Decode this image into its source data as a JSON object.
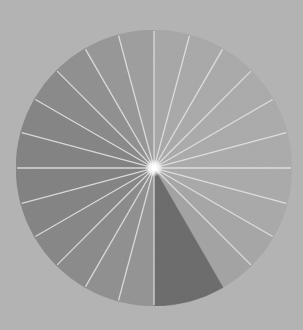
{
  "stimulus": {
    "canvas": {
      "width": 303,
      "height": 330,
      "background": "#b3b3b3"
    },
    "disc": {
      "cx": 154,
      "cy": 168,
      "r": 138
    },
    "sector_angle_deg": 15,
    "sectors": [
      {
        "start": 0,
        "end": 15,
        "color": "#a9a9a9"
      },
      {
        "start": 15,
        "end": 30,
        "color": "#ababab"
      },
      {
        "start": 30,
        "end": 45,
        "color": "#acacac"
      },
      {
        "start": 45,
        "end": 60,
        "color": "#adadad"
      },
      {
        "start": 60,
        "end": 75,
        "color": "#adadad"
      },
      {
        "start": 75,
        "end": 90,
        "color": "#adadad"
      },
      {
        "start": 90,
        "end": 105,
        "color": "#acacac"
      },
      {
        "start": 105,
        "end": 120,
        "color": "#ababab"
      },
      {
        "start": 120,
        "end": 135,
        "color": "#a8a8a8"
      },
      {
        "start": 135,
        "end": 150,
        "color": "#a5a5a5"
      },
      {
        "start": 150,
        "end": 180,
        "color": "#6e6e6e",
        "target": true
      },
      {
        "start": 180,
        "end": 195,
        "color": "#969696"
      },
      {
        "start": 195,
        "end": 210,
        "color": "#929292"
      },
      {
        "start": 210,
        "end": 225,
        "color": "#8d8d8d"
      },
      {
        "start": 225,
        "end": 240,
        "color": "#898989"
      },
      {
        "start": 240,
        "end": 255,
        "color": "#868686"
      },
      {
        "start": 255,
        "end": 270,
        "color": "#848484"
      },
      {
        "start": 270,
        "end": 285,
        "color": "#858585"
      },
      {
        "start": 285,
        "end": 300,
        "color": "#878787"
      },
      {
        "start": 300,
        "end": 315,
        "color": "#8c8c8c"
      },
      {
        "start": 315,
        "end": 330,
        "color": "#929292"
      },
      {
        "start": 330,
        "end": 345,
        "color": "#999999"
      },
      {
        "start": 345,
        "end": 360,
        "color": "#a0a0a0"
      }
    ],
    "spokes": {
      "color": "#e6e6e6",
      "width": 1.3,
      "angles": [
        0,
        15,
        30,
        45,
        60,
        75,
        90,
        105,
        120,
        135,
        180,
        195,
        210,
        225,
        240,
        255,
        270,
        285,
        300,
        315,
        330,
        345
      ]
    },
    "fixation": {
      "color": "#ffffff",
      "glow": "#f4f4f4",
      "r": 3
    }
  }
}
